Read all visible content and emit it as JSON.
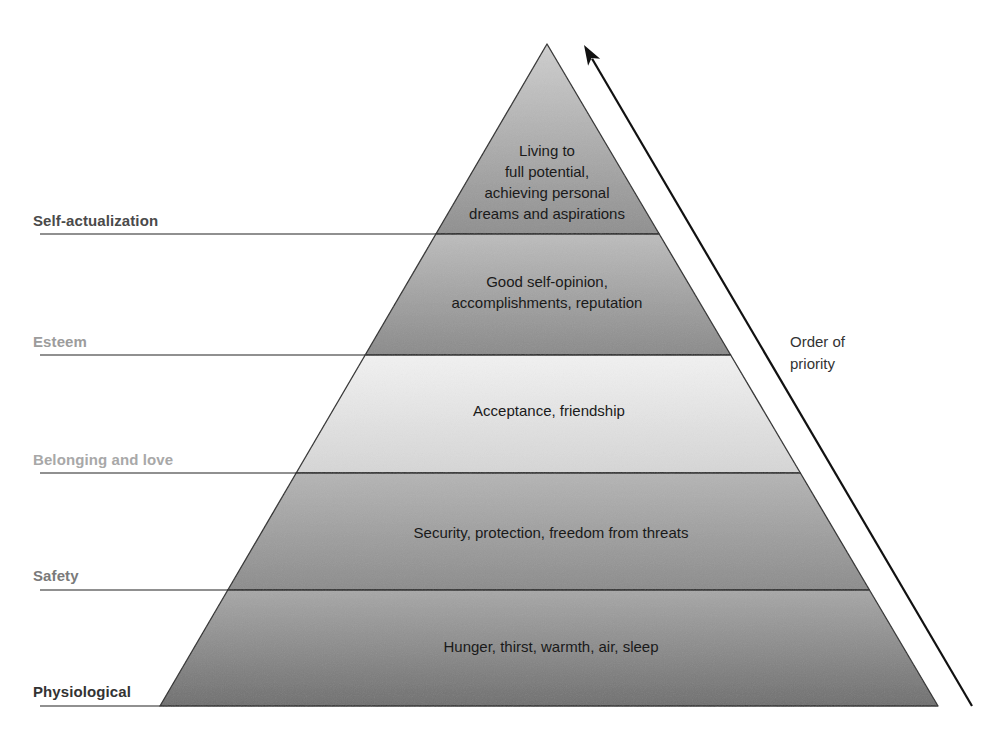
{
  "diagram": {
    "geometry": {
      "apex": [
        547,
        44
      ],
      "base_left": [
        160,
        706
      ],
      "base_right": [
        938,
        706
      ],
      "dividers_y": [
        234,
        355,
        473,
        590
      ]
    },
    "levels": [
      {
        "name": "Self-actualization",
        "label_color": "#4a4a4a",
        "description_lines": [
          "Living to",
          "full potential,",
          "achieving personal",
          "dreams and aspirations"
        ],
        "fill_top": "#cfcfcf",
        "fill_bottom": "#8f8f8f"
      },
      {
        "name": "Esteem",
        "label_color": "#9c9c9c",
        "description_lines": [
          "Good self-opinion,",
          "accomplishments, reputation"
        ],
        "fill_top": "#bdbdbd",
        "fill_bottom": "#8a8a8a"
      },
      {
        "name": "Belonging and love",
        "label_color": "#a8a8a8",
        "description_lines": [
          "Acceptance, friendship"
        ],
        "fill_top": "#f2f2f2",
        "fill_bottom": "#d6d6d6"
      },
      {
        "name": "Safety",
        "label_color": "#7a7a7a",
        "description_lines": [
          "Security, protection, freedom from threats"
        ],
        "fill_top": "#b5b5b5",
        "fill_bottom": "#8c8c8c"
      },
      {
        "name": "Physiological",
        "label_color": "#333333",
        "description_lines": [
          "Hunger, thirst, warmth, air, sleep"
        ],
        "fill_top": "#a8a8a8",
        "fill_bottom": "#6f6f6f"
      }
    ],
    "arrow": {
      "label_lines": [
        "Order of",
        "priority"
      ],
      "from": [
        972,
        706
      ],
      "to": [
        584,
        45
      ],
      "color": "#111111"
    }
  }
}
